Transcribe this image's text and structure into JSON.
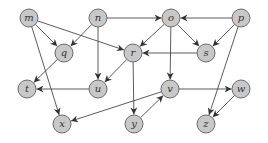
{
  "diagram": {
    "type": "directed-graph",
    "colors": {
      "node_fill": "#c8c8c8",
      "node_stroke": "#6a6a6a",
      "edge": "#4a4a4a",
      "label": "#333333"
    },
    "node_radius": 9,
    "nodes": [
      {
        "id": "m",
        "label": "m",
        "x": 29,
        "y": 18
      },
      {
        "id": "n",
        "label": "n",
        "x": 98,
        "y": 18
      },
      {
        "id": "o",
        "label": "o",
        "x": 171,
        "y": 18
      },
      {
        "id": "p",
        "label": "p",
        "x": 241,
        "y": 18
      },
      {
        "id": "q",
        "label": "q",
        "x": 64,
        "y": 53
      },
      {
        "id": "r",
        "label": "r",
        "x": 133,
        "y": 53
      },
      {
        "id": "s",
        "label": "s",
        "x": 206,
        "y": 53
      },
      {
        "id": "t",
        "label": "t",
        "x": 27,
        "y": 89
      },
      {
        "id": "u",
        "label": "u",
        "x": 98,
        "y": 89
      },
      {
        "id": "v",
        "label": "v",
        "x": 170,
        "y": 89
      },
      {
        "id": "w",
        "label": "w",
        "x": 241,
        "y": 89
      },
      {
        "id": "x",
        "label": "x",
        "x": 62,
        "y": 124
      },
      {
        "id": "y",
        "label": "y",
        "x": 134,
        "y": 124
      },
      {
        "id": "z",
        "label": "z",
        "x": 206,
        "y": 124
      }
    ],
    "edges": [
      {
        "from": "m",
        "to": "q"
      },
      {
        "from": "m",
        "to": "r"
      },
      {
        "from": "m",
        "to": "x"
      },
      {
        "from": "n",
        "to": "o"
      },
      {
        "from": "n",
        "to": "q"
      },
      {
        "from": "n",
        "to": "u"
      },
      {
        "from": "o",
        "to": "r"
      },
      {
        "from": "o",
        "to": "s"
      },
      {
        "from": "o",
        "to": "v"
      },
      {
        "from": "p",
        "to": "o"
      },
      {
        "from": "p",
        "to": "s"
      },
      {
        "from": "p",
        "to": "z"
      },
      {
        "from": "q",
        "to": "t"
      },
      {
        "from": "r",
        "to": "u"
      },
      {
        "from": "r",
        "to": "y"
      },
      {
        "from": "s",
        "to": "r"
      },
      {
        "from": "u",
        "to": "t"
      },
      {
        "from": "v",
        "to": "w"
      },
      {
        "from": "v",
        "to": "x"
      },
      {
        "from": "y",
        "to": "v"
      },
      {
        "from": "w",
        "to": "z"
      }
    ]
  }
}
